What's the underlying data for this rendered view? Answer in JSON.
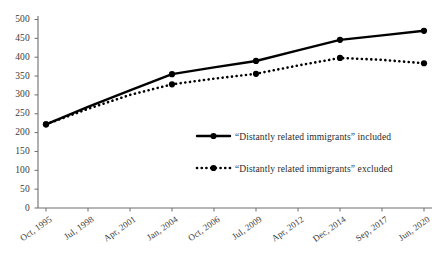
{
  "chart_data": {
    "type": "line",
    "title": "",
    "subtitle": "",
    "xlabel": "",
    "ylabel": "",
    "ylim": [
      0,
      500
    ],
    "y_ticks": [
      0,
      50,
      100,
      150,
      200,
      250,
      300,
      350,
      400,
      450,
      500
    ],
    "grid": false,
    "legend_position": "center-right-inside",
    "categories": [
      "Oct, 1995",
      "Jul, 1998",
      "Apr, 2001",
      "Jan, 2004",
      "Oct, 2006",
      "Jul, 2009",
      "Apr, 2012",
      "Dec, 2014",
      "Sep, 2017",
      "Jun, 2020"
    ],
    "series": [
      {
        "name": "“Distantly related immigrants” included",
        "style": "solid",
        "color": "#000000",
        "marker": "circle",
        "marker_at": [
          "Oct, 1995",
          "Jan, 2004",
          "Jul, 2009",
          "Dec, 2014",
          "Jun, 2020"
        ],
        "values": [
          222,
          268,
          312,
          355,
          373,
          390,
          418,
          446,
          458,
          470
        ]
      },
      {
        "name": "“Distantly related immigrants” excluded",
        "style": "dotted",
        "color": "#000000",
        "marker": "circle",
        "marker_at": [
          "Oct, 1995",
          "Jan, 2004",
          "Jul, 2009",
          "Dec, 2014",
          "Jun, 2020"
        ],
        "values": [
          222,
          263,
          300,
          328,
          343,
          356,
          378,
          398,
          393,
          384
        ]
      }
    ]
  },
  "axis": {
    "y_tick_labels": [
      "500",
      "450",
      "400",
      "350",
      "300",
      "250",
      "200",
      "150",
      "100",
      "50",
      "0"
    ],
    "x_tick_labels": [
      "Oct, 1995",
      "Jul, 1998",
      "Apr, 2001",
      "Jan, 2004",
      "Oct, 2006",
      "Jul, 2009",
      "Apr, 2012",
      "Dec, 2014",
      "Sep, 2017",
      "Jun, 2020"
    ]
  },
  "legend": {
    "items": [
      {
        "label": "“Distantly related immigrants” included"
      },
      {
        "label": "“Distantly related immigrants” excluded"
      }
    ]
  }
}
